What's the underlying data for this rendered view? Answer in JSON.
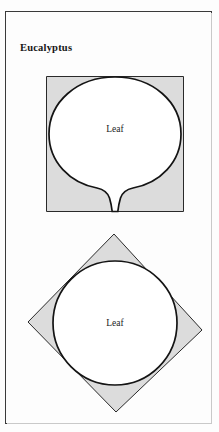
{
  "page": {
    "title": "Eucalyptus",
    "background_color": "#fdfdfd",
    "frame_color": "#3a3a3a"
  },
  "palette": {
    "shape_fill_gray": "#dcdcdc",
    "shape_fill_white": "#ffffff",
    "outline_dark": "#141414",
    "outline_thin": "#2a2a2a",
    "text_color": "#1c1c1c"
  },
  "figures": [
    {
      "id": "figure-balloon-in-square",
      "name": "balloon-leaf-in-square",
      "container_shape": "square",
      "container_fill": "#dcdcdc",
      "inner_shape": "balloon",
      "inner_fill": "#ffffff",
      "label": "Leaf"
    },
    {
      "id": "figure-circle-in-diamond",
      "name": "circle-leaf-in-diamond",
      "container_shape": "diamond",
      "container_fill": "#dcdcdc",
      "inner_shape": "circle",
      "inner_fill": "#ffffff",
      "label": "Leaf"
    }
  ]
}
